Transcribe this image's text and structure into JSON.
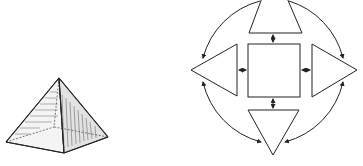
{
  "figure": {
    "width": 363,
    "height": 166,
    "background": "#ffffff",
    "stroke_color": "#222222",
    "left_panel": {
      "subject": "pyramid",
      "style": "hatched-sketch"
    },
    "right_panel": {
      "subject": "square-with-four-triangles-in-circle",
      "center_shape": "square",
      "surrounding_shapes": [
        "triangle-top",
        "triangle-left",
        "triangle-right",
        "triangle-bottom"
      ],
      "connectors": "double-headed-arrows",
      "outer_arcs": 4
    }
  }
}
